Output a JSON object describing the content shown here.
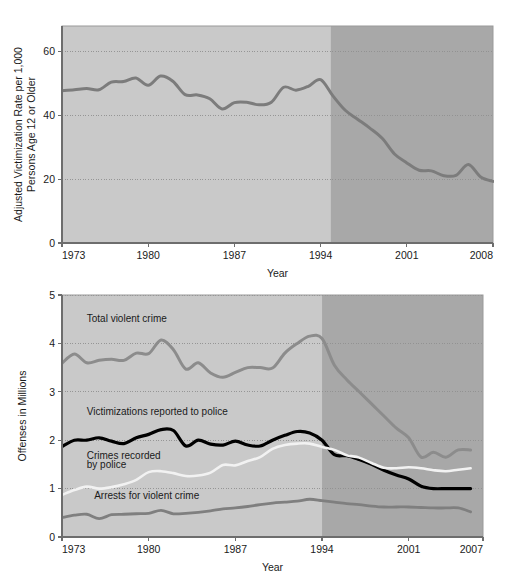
{
  "figure": {
    "background_color": "#ffffff",
    "band_light_color": "#c9c9c9",
    "band_dark_color": "#a8a8a8",
    "axis_color": "#6d6d6d",
    "grid_color": "#8f8f8f"
  },
  "chart_data": [
    {
      "id": "victimization-rate",
      "type": "line",
      "title": "",
      "xlabel": "Year",
      "ylabel": "Adjusted Victimization Rate per 1,000 Persons Age 12 or Older",
      "xlim": [
        1973,
        2008
      ],
      "ylim": [
        0,
        68
      ],
      "xticks": [
        1973,
        1980,
        1987,
        1994,
        2001,
        2008
      ],
      "xticklabels": [
        "1973",
        "1980",
        "1987",
        "1994",
        "2001",
        "2008"
      ],
      "yticks": [
        0,
        20,
        40,
        60
      ],
      "yticklabels": [
        "0",
        "20",
        "40",
        "60"
      ],
      "grid": "horizontal-dotted",
      "legend": "none",
      "shaded_bands": [
        {
          "from": 1973,
          "to": 1994.8,
          "color": "#c9c9c9"
        },
        {
          "from": 1994.8,
          "to": 2008,
          "color": "#a8a8a8"
        }
      ],
      "series": [
        {
          "name": "Adjusted victimization rate",
          "color": "#7c7c7c",
          "linewidth": 3.0,
          "x": [
            1973,
            1974,
            1975,
            1976,
            1977,
            1978,
            1979,
            1980,
            1981,
            1982,
            1983,
            1984,
            1985,
            1986,
            1987,
            1988,
            1989,
            1990,
            1991,
            1992,
            1993,
            1994,
            1995,
            1996,
            1997,
            1998,
            1999,
            2000,
            2001,
            2002,
            2003,
            2004,
            2005,
            2006,
            2007,
            2008
          ],
          "values": [
            47.7,
            48.0,
            48.4,
            48.0,
            50.4,
            50.6,
            51.7,
            49.4,
            52.3,
            50.7,
            46.5,
            46.4,
            45.2,
            42.0,
            44.0,
            44.1,
            43.3,
            44.1,
            48.8,
            47.9,
            49.1,
            51.2,
            46.1,
            41.6,
            38.8,
            36.0,
            32.8,
            27.9,
            25.1,
            22.8,
            22.6,
            21.1,
            21.2,
            24.6,
            20.7,
            19.3
          ]
        }
      ]
    },
    {
      "id": "offenses-in-millions",
      "type": "line",
      "title": "",
      "xlabel": "Year",
      "ylabel": "Offenses in Millions",
      "xlim": [
        1973,
        2007
      ],
      "ylim": [
        0,
        5
      ],
      "xticks": [
        1973,
        1980,
        1987,
        1994,
        2001,
        2007
      ],
      "xticklabels": [
        "1973",
        "1980",
        "1987",
        "1994",
        "2001",
        "2007"
      ],
      "yticks": [
        0,
        1,
        2,
        3,
        4,
        5
      ],
      "yticklabels": [
        "0",
        "1",
        "2",
        "3",
        "4",
        "5"
      ],
      "grid": "horizontal-dotted",
      "legend": "inline-labels",
      "shaded_bands": [
        {
          "from": 1973,
          "to": 1994.0,
          "color": "#c9c9c9"
        },
        {
          "from": 1994.0,
          "to": 2007,
          "color": "#a8a8a8"
        }
      ],
      "annotations": [
        {
          "text": "Total violent crime",
          "x": 1975.0,
          "y": 4.45
        },
        {
          "text": "Victimizations reported to police",
          "x": 1975.0,
          "y": 2.52
        },
        {
          "text": "Crimes recorded",
          "x": 1975.0,
          "y": 1.62
        },
        {
          "text": "by police",
          "x": 1975.0,
          "y": 1.42
        },
        {
          "text": "Arrests for violent crime",
          "x": 1975.6,
          "y": 0.78
        }
      ],
      "series": [
        {
          "name": "Total violent crime",
          "color": "#8c8c8c",
          "linewidth": 3.0,
          "x": [
            1973,
            1974,
            1975,
            1976,
            1977,
            1978,
            1979,
            1980,
            1981,
            1982,
            1983,
            1984,
            1985,
            1986,
            1987,
            1988,
            1989,
            1990,
            1991,
            1992,
            1993,
            1994,
            1995,
            1996,
            1997,
            1998,
            1999,
            2000,
            2001,
            2002,
            2003,
            2004,
            2005,
            2006
          ],
          "values": [
            3.59,
            3.78,
            3.6,
            3.65,
            3.67,
            3.65,
            3.8,
            3.79,
            4.07,
            3.87,
            3.47,
            3.6,
            3.39,
            3.3,
            3.4,
            3.5,
            3.5,
            3.49,
            3.8,
            4.0,
            4.15,
            4.1,
            3.55,
            3.25,
            3.0,
            2.75,
            2.5,
            2.25,
            2.05,
            1.65,
            1.75,
            1.65,
            1.8,
            1.8
          ]
        },
        {
          "name": "Victimizations reported to police",
          "color": "#000000",
          "linewidth": 3.2,
          "x": [
            1973,
            1974,
            1975,
            1976,
            1977,
            1978,
            1979,
            1980,
            1981,
            1982,
            1983,
            1984,
            1985,
            1986,
            1987,
            1988,
            1989,
            1990,
            1991,
            1992,
            1993,
            1994,
            1995,
            1996,
            1997,
            1998,
            1999,
            2000,
            2001,
            2002,
            2003,
            2004,
            2005,
            2006
          ],
          "values": [
            1.87,
            2.0,
            2.0,
            2.05,
            1.98,
            1.93,
            2.05,
            2.12,
            2.22,
            2.2,
            1.88,
            2.0,
            1.92,
            1.9,
            1.98,
            1.9,
            1.88,
            2.0,
            2.1,
            2.18,
            2.15,
            2.0,
            1.7,
            1.68,
            1.6,
            1.5,
            1.38,
            1.28,
            1.2,
            1.05,
            1.0,
            1.0,
            1.0,
            1.0
          ]
        },
        {
          "name": "Crimes recorded by police",
          "color": "#f2f2f2",
          "linewidth": 2.6,
          "x": [
            1973,
            1974,
            1975,
            1976,
            1977,
            1978,
            1979,
            1980,
            1981,
            1982,
            1983,
            1984,
            1985,
            1986,
            1987,
            1988,
            1989,
            1990,
            1991,
            1992,
            1993,
            1994,
            1995,
            1996,
            1997,
            1998,
            1999,
            2000,
            2001,
            2002,
            2003,
            2004,
            2005,
            2006
          ],
          "values": [
            0.87,
            0.97,
            1.04,
            1.0,
            1.03,
            1.09,
            1.18,
            1.34,
            1.36,
            1.32,
            1.26,
            1.27,
            1.33,
            1.49,
            1.48,
            1.57,
            1.65,
            1.82,
            1.9,
            1.93,
            1.93,
            1.86,
            1.8,
            1.69,
            1.64,
            1.53,
            1.43,
            1.42,
            1.44,
            1.42,
            1.38,
            1.36,
            1.39,
            1.42
          ]
        },
        {
          "name": "Arrests for violent crime",
          "color": "#7f7f7f",
          "linewidth": 2.8,
          "x": [
            1973,
            1974,
            1975,
            1976,
            1977,
            1978,
            1979,
            1980,
            1981,
            1982,
            1983,
            1984,
            1985,
            1986,
            1987,
            1988,
            1989,
            1990,
            1991,
            1992,
            1993,
            1994,
            1995,
            1996,
            1997,
            1998,
            1999,
            2000,
            2001,
            2002,
            2003,
            2004,
            2005,
            2006
          ],
          "values": [
            0.4,
            0.45,
            0.47,
            0.38,
            0.46,
            0.47,
            0.48,
            0.49,
            0.55,
            0.48,
            0.49,
            0.51,
            0.54,
            0.58,
            0.6,
            0.63,
            0.67,
            0.7,
            0.72,
            0.74,
            0.78,
            0.75,
            0.72,
            0.69,
            0.67,
            0.64,
            0.62,
            0.62,
            0.62,
            0.61,
            0.6,
            0.6,
            0.6,
            0.52
          ]
        }
      ]
    }
  ]
}
